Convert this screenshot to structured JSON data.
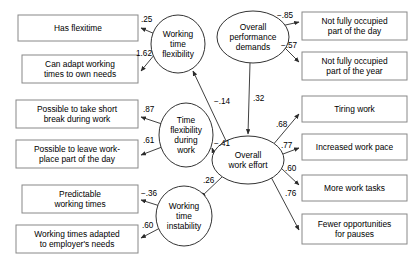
{
  "diagram": {
    "type": "structural-equation-model",
    "title": "",
    "background_color": "#ffffff",
    "line_color": "#2b2b2b",
    "box_stroke_color": "#888888",
    "ellipse_stroke_color": "#333333"
  },
  "latent_variables": [
    {
      "id": "working_time_flexibility",
      "label_lines": [
        "Working",
        "time",
        "flexibility"
      ],
      "cx": 178,
      "cy": 44,
      "rx": 27,
      "ry": 29
    },
    {
      "id": "overall_performance_demands",
      "label_lines": [
        "Overall",
        "performance",
        "demands"
      ],
      "cx": 253,
      "cy": 37,
      "rx": 36,
      "ry": 26
    },
    {
      "id": "time_flexibility_during_work",
      "label_lines": [
        "Time",
        "flexibility",
        "during",
        "work"
      ],
      "cx": 186,
      "cy": 135,
      "rx": 27,
      "ry": 32
    },
    {
      "id": "overall_work_effort",
      "label_lines": [
        "Overall",
        "work effort"
      ],
      "cx": 248,
      "cy": 160,
      "rx": 36,
      "ry": 24
    },
    {
      "id": "working_time_instability",
      "label_lines": [
        "Working",
        "time",
        "instability"
      ],
      "cx": 184,
      "cy": 216,
      "rx": 28,
      "ry": 30
    }
  ],
  "observed_variables": [
    {
      "id": "has_flexitime",
      "label_lines": [
        "Has flexitime"
      ],
      "x": 18,
      "y": 15,
      "w": 120,
      "h": 26
    },
    {
      "id": "can_adapt_working_times",
      "label_lines": [
        "Can adapt working",
        "times to own needs"
      ],
      "x": 22,
      "y": 55,
      "w": 116,
      "h": 28
    },
    {
      "id": "possible_short_break",
      "label_lines": [
        "Possible to take short",
        "break during work"
      ],
      "x": 16,
      "y": 100,
      "w": 122,
      "h": 28
    },
    {
      "id": "possible_leave_workplace",
      "label_lines": [
        "Possible to leave work-",
        "place part of the day"
      ],
      "x": 16,
      "y": 140,
      "w": 122,
      "h": 28
    },
    {
      "id": "predictable_working_times",
      "label_lines": [
        "Predictable",
        "working times"
      ],
      "x": 22,
      "y": 185,
      "w": 116,
      "h": 28
    },
    {
      "id": "working_times_adapted_employer",
      "label_lines": [
        "Working times adapted",
        "to employer's needs"
      ],
      "x": 16,
      "y": 225,
      "w": 122,
      "h": 28
    },
    {
      "id": "not_fully_occupied_day",
      "label_lines": [
        "Not fully occupied",
        "part of the day"
      ],
      "x": 302,
      "y": 12,
      "w": 105,
      "h": 28
    },
    {
      "id": "not_fully_occupied_year",
      "label_lines": [
        "Not fully occupied",
        "part of the year"
      ],
      "x": 302,
      "y": 52,
      "w": 105,
      "h": 28
    },
    {
      "id": "tiring_work",
      "label_lines": [
        "Tiring work"
      ],
      "x": 302,
      "y": 96,
      "w": 105,
      "h": 26
    },
    {
      "id": "increased_work_pace",
      "label_lines": [
        "Increased work pace"
      ],
      "x": 302,
      "y": 134,
      "w": 105,
      "h": 26
    },
    {
      "id": "more_work_tasks",
      "label_lines": [
        "More work tasks"
      ],
      "x": 302,
      "y": 175,
      "w": 105,
      "h": 26
    },
    {
      "id": "fewer_opportunities_pauses",
      "label_lines": [
        "Fewer opportunities",
        "for pauses"
      ],
      "x": 302,
      "y": 214,
      "w": 105,
      "h": 30
    }
  ],
  "paths": [
    {
      "id": "wtf_to_has_flexitime",
      "from": "working_time_flexibility",
      "to": "has_flexitime",
      "coefficient": ".25",
      "x1": 155,
      "y1": 34,
      "x2": 141,
      "y2": 28,
      "label_x": 141,
      "label_y": 22
    },
    {
      "id": "wtf_to_can_adapt",
      "from": "working_time_flexibility",
      "to": "can_adapt_working_times",
      "coefficient": "1.62",
      "x1": 155,
      "y1": 54,
      "x2": 141,
      "y2": 71,
      "label_x": 136,
      "label_y": 56
    },
    {
      "id": "tfdw_to_short_break",
      "from": "time_flexibility_during_work",
      "to": "possible_short_break",
      "coefficient": ".87",
      "x1": 162,
      "y1": 124,
      "x2": 141,
      "y2": 117,
      "label_x": 143,
      "label_y": 112
    },
    {
      "id": "tfdw_to_leave_workplace",
      "from": "time_flexibility_during_work",
      "to": "possible_leave_workplace",
      "coefficient": ".61",
      "x1": 162,
      "y1": 147,
      "x2": 141,
      "y2": 155,
      "label_x": 143,
      "label_y": 143
    },
    {
      "id": "wti_to_predictable",
      "from": "working_time_instability",
      "to": "predictable_working_times",
      "coefficient": "−.36",
      "x1": 160,
      "y1": 206,
      "x2": 141,
      "y2": 200,
      "label_x": 141,
      "label_y": 196
    },
    {
      "id": "wti_to_adapted_employer",
      "from": "working_time_instability",
      "to": "working_times_adapted_employer",
      "coefficient": ".60",
      "x1": 160,
      "y1": 228,
      "x2": 141,
      "y2": 238,
      "label_x": 142,
      "label_y": 228
    },
    {
      "id": "opd_to_not_occupied_day",
      "from": "overall_performance_demands",
      "to": "not_fully_occupied_day",
      "coefficient": "−.85",
      "x1": 281,
      "y1": 26,
      "x2": 299,
      "y2": 22,
      "label_x": 277,
      "label_y": 18
    },
    {
      "id": "opd_to_not_occupied_year",
      "from": "overall_performance_demands",
      "to": "not_fully_occupied_year",
      "coefficient": "−.57",
      "x1": 284,
      "y1": 47,
      "x2": 299,
      "y2": 62,
      "label_x": 281,
      "label_y": 48
    },
    {
      "id": "opd_to_owe",
      "from": "overall_performance_demands",
      "to": "overall_work_effort",
      "coefficient": ".32",
      "x1": 250,
      "y1": 63,
      "x2": 248,
      "y2": 134,
      "label_x": 253,
      "label_y": 101
    },
    {
      "id": "owe_to_wtf",
      "from": "overall_work_effort",
      "to": "working_time_flexibility",
      "coefficient": "−.14",
      "x1": 227,
      "y1": 143,
      "x2": 193,
      "y2": 71,
      "label_x": 214,
      "label_y": 104
    },
    {
      "id": "owe_to_tfdw",
      "from": "overall_work_effort",
      "to": "time_flexibility_during_work",
      "coefficient": "−.41",
      "x1": 214,
      "y1": 153,
      "x2": 212,
      "y2": 148,
      "label_x": 214,
      "label_y": 146
    },
    {
      "id": "owe_to_wti",
      "from": "overall_work_effort",
      "to": "working_time_instability",
      "coefficient": ".26",
      "x1": 223,
      "y1": 176,
      "x2": 201,
      "y2": 197,
      "label_x": 203,
      "label_y": 183
    },
    {
      "id": "owe_to_tiring_work",
      "from": "overall_work_effort",
      "to": "tiring_work",
      "coefficient": ".68",
      "x1": 272,
      "y1": 146,
      "x2": 299,
      "y2": 114,
      "label_x": 276,
      "label_y": 127
    },
    {
      "id": "owe_to_increased_pace",
      "from": "overall_work_effort",
      "to": "increased_work_pace",
      "coefficient": ".77",
      "x1": 283,
      "y1": 154,
      "x2": 299,
      "y2": 148,
      "label_x": 281,
      "label_y": 148
    },
    {
      "id": "owe_to_more_tasks",
      "from": "overall_work_effort",
      "to": "more_work_tasks",
      "coefficient": ".60",
      "x1": 281,
      "y1": 168,
      "x2": 299,
      "y2": 185,
      "label_x": 285,
      "label_y": 171
    },
    {
      "id": "owe_to_fewer_pauses",
      "from": "overall_work_effort",
      "to": "fewer_opportunities_pauses",
      "coefficient": ".76",
      "x1": 271,
      "y1": 177,
      "x2": 299,
      "y2": 230,
      "label_x": 285,
      "label_y": 196
    }
  ]
}
